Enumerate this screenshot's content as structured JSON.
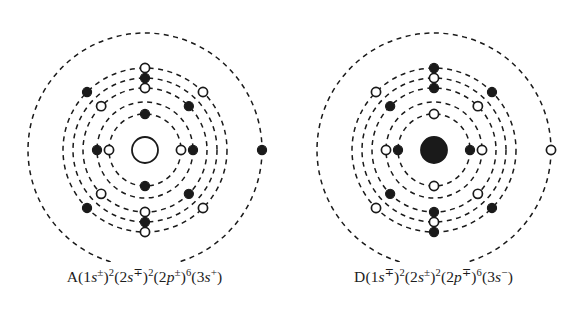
{
  "figure": {
    "background_color": "#ffffff",
    "stroke_color": "#1a1a1a",
    "panel_count": 2
  },
  "chart_data": {
    "type": "diagram",
    "subtype": "bohr-atomic-shell-model",
    "title": "",
    "marker_legend": {
      "filled": "filled dot electron",
      "open": "open circle electron"
    },
    "panels": [
      {
        "id": "panel-a",
        "label": "A",
        "nucleus": {
          "style": "open",
          "radius": 13
        },
        "center": {
          "x": 145,
          "y": 150
        },
        "rings": [
          {
            "index": 1,
            "radius": 36
          },
          {
            "index": 2,
            "radius": 48
          },
          {
            "index": 3,
            "radius": 62
          },
          {
            "index": 4,
            "radius": 72
          },
          {
            "index": 5,
            "radius": 82
          },
          {
            "index": 6,
            "radius": 117
          }
        ],
        "electrons": [
          {
            "ring": 1,
            "angle": 90,
            "style": "filled"
          },
          {
            "ring": 1,
            "angle": 270,
            "style": "filled"
          },
          {
            "ring": 1,
            "angle": 0,
            "style": "open"
          },
          {
            "ring": 1,
            "angle": 180,
            "style": "open"
          },
          {
            "ring": 2,
            "angle": 0,
            "style": "filled"
          },
          {
            "ring": 2,
            "angle": 180,
            "style": "filled"
          },
          {
            "ring": 3,
            "angle": 90,
            "style": "open"
          },
          {
            "ring": 3,
            "angle": 270,
            "style": "open"
          },
          {
            "ring": 4,
            "angle": 90,
            "style": "filled"
          },
          {
            "ring": 4,
            "angle": 270,
            "style": "filled"
          },
          {
            "ring": 5,
            "angle": 90,
            "style": "open"
          },
          {
            "ring": 5,
            "angle": 270,
            "style": "open"
          },
          {
            "ring": 3,
            "angle": 45,
            "style": "filled"
          },
          {
            "ring": 5,
            "angle": 45,
            "style": "open"
          },
          {
            "ring": 3,
            "angle": 135,
            "style": "open"
          },
          {
            "ring": 5,
            "angle": 135,
            "style": "filled"
          },
          {
            "ring": 3,
            "angle": 225,
            "style": "open"
          },
          {
            "ring": 5,
            "angle": 225,
            "style": "filled"
          },
          {
            "ring": 3,
            "angle": 315,
            "style": "filled"
          },
          {
            "ring": 5,
            "angle": 315,
            "style": "open"
          },
          {
            "ring": 6,
            "angle": 0,
            "style": "filled"
          }
        ]
      },
      {
        "id": "panel-d",
        "label": "D",
        "nucleus": {
          "style": "filled",
          "radius": 13
        },
        "center": {
          "x": 145,
          "y": 150
        },
        "rings": [
          {
            "index": 1,
            "radius": 36
          },
          {
            "index": 2,
            "radius": 48
          },
          {
            "index": 3,
            "radius": 62
          },
          {
            "index": 4,
            "radius": 72
          },
          {
            "index": 5,
            "radius": 82
          },
          {
            "index": 6,
            "radius": 117
          }
        ],
        "electrons": [
          {
            "ring": 1,
            "angle": 90,
            "style": "open"
          },
          {
            "ring": 1,
            "angle": 270,
            "style": "open"
          },
          {
            "ring": 1,
            "angle": 0,
            "style": "filled"
          },
          {
            "ring": 1,
            "angle": 180,
            "style": "filled"
          },
          {
            "ring": 2,
            "angle": 0,
            "style": "open"
          },
          {
            "ring": 2,
            "angle": 180,
            "style": "open"
          },
          {
            "ring": 3,
            "angle": 90,
            "style": "filled"
          },
          {
            "ring": 3,
            "angle": 270,
            "style": "filled"
          },
          {
            "ring": 4,
            "angle": 90,
            "style": "open"
          },
          {
            "ring": 4,
            "angle": 270,
            "style": "open"
          },
          {
            "ring": 5,
            "angle": 90,
            "style": "filled"
          },
          {
            "ring": 5,
            "angle": 270,
            "style": "filled"
          },
          {
            "ring": 3,
            "angle": 45,
            "style": "open"
          },
          {
            "ring": 5,
            "angle": 45,
            "style": "filled"
          },
          {
            "ring": 3,
            "angle": 135,
            "style": "filled"
          },
          {
            "ring": 5,
            "angle": 135,
            "style": "open"
          },
          {
            "ring": 3,
            "angle": 225,
            "style": "filled"
          },
          {
            "ring": 5,
            "angle": 225,
            "style": "open"
          },
          {
            "ring": 3,
            "angle": 315,
            "style": "open"
          },
          {
            "ring": 5,
            "angle": 315,
            "style": "filled"
          },
          {
            "ring": 6,
            "angle": 0,
            "style": "open"
          }
        ]
      }
    ]
  },
  "captions": {
    "left": {
      "element": "A",
      "text": "A(1s±)2(2s∓)2(2p±)6(3s+)",
      "terms": [
        {
          "shell": "1s",
          "sign": "±",
          "count": "2"
        },
        {
          "shell": "2s",
          "sign": "∓",
          "count": "2"
        },
        {
          "shell": "2p",
          "sign": "±",
          "count": "6"
        },
        {
          "shell": "3s",
          "sign": "+",
          "count": ""
        }
      ]
    },
    "right": {
      "element": "D",
      "text": "D(1s∓)2(2s±)2(2p∓)6(3s−)",
      "terms": [
        {
          "shell": "1s",
          "sign": "∓",
          "count": "2"
        },
        {
          "shell": "2s",
          "sign": "±",
          "count": "2"
        },
        {
          "shell": "2p",
          "sign": "∓",
          "count": "6"
        },
        {
          "shell": "3s",
          "sign": "−",
          "count": ""
        }
      ]
    }
  }
}
